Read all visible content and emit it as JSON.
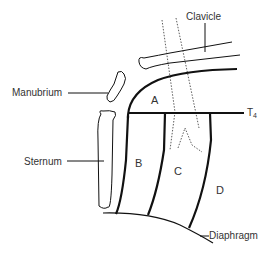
{
  "diagram": {
    "labels": {
      "clavicle": "Clavicle",
      "manubrium": "Manubrium",
      "sternum": "Sternum",
      "t4_main": "T",
      "t4_sub": "4",
      "diaphragm": "Diaphragm"
    },
    "regions": {
      "a": "A",
      "b": "B",
      "c": "C",
      "d": "D"
    },
    "colors": {
      "line": "#111111",
      "text": "#333333",
      "background": "#ffffff"
    }
  }
}
